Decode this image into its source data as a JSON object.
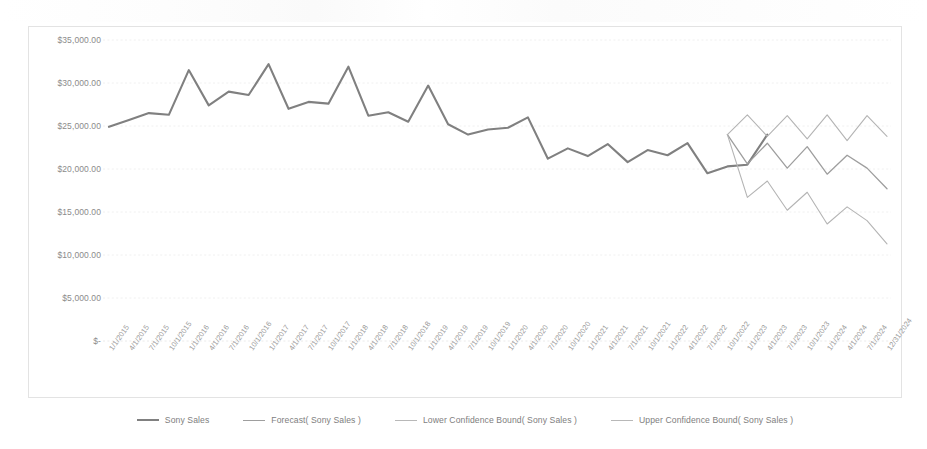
{
  "chart_data": {
    "type": "line",
    "title": "",
    "xlabel": "",
    "ylabel": "",
    "ylim": [
      0,
      35000
    ],
    "ytick_values": [
      35000,
      30000,
      25000,
      20000,
      15000,
      10000,
      5000,
      0
    ],
    "ytick_labels": [
      "$35,000.00",
      "$30,000.00",
      "$25,000.00",
      "$20,000.00",
      "$15,000.00",
      "$10,000.00",
      "$5,000.00",
      "$-"
    ],
    "grid": true,
    "legend_position": "bottom",
    "x": [
      "1/1/2015",
      "4/1/2015",
      "7/1/2015",
      "10/1/2015",
      "1/1/2016",
      "4/1/2016",
      "7/1/2016",
      "10/1/2016",
      "1/1/2017",
      "4/1/2017",
      "7/1/2017",
      "10/1/2017",
      "1/1/2018",
      "4/1/2018",
      "7/1/2018",
      "10/1/2018",
      "1/1/2019",
      "4/1/2019",
      "7/1/2019",
      "10/1/2019",
      "1/1/2020",
      "4/1/2020",
      "7/1/2020",
      "10/1/2020",
      "1/1/2021",
      "4/1/2021",
      "7/1/2021",
      "10/1/2021",
      "1/1/2022",
      "4/1/2022",
      "7/1/2022",
      "10/1/2022",
      "1/1/2023",
      "4/1/2023",
      "7/1/2023",
      "10/1/2023",
      "1/1/2024",
      "4/1/2024",
      "7/1/2024",
      "12/31/2024"
    ],
    "series": [
      {
        "name": "Sony Sales",
        "color": "#808080",
        "width": 2.1,
        "values": [
          24900,
          25700,
          26500,
          26300,
          31500,
          27400,
          29000,
          28600,
          32200,
          27000,
          27800,
          27600,
          31900,
          26200,
          26600,
          25500,
          29700,
          25200,
          24000,
          24600,
          24800,
          26000,
          21200,
          22400,
          21500,
          22900,
          20800,
          22200,
          21600,
          23000,
          19500,
          20300,
          20500,
          24000,
          null,
          null,
          null,
          null,
          null,
          null
        ]
      },
      {
        "name": "Forecast( Sony Sales )",
        "color": "#9e9e9e",
        "width": 1.3,
        "values": [
          null,
          null,
          null,
          null,
          null,
          null,
          null,
          null,
          null,
          null,
          null,
          null,
          null,
          null,
          null,
          null,
          null,
          null,
          null,
          null,
          null,
          null,
          null,
          null,
          null,
          null,
          null,
          null,
          null,
          null,
          null,
          24000,
          20600,
          23000,
          20100,
          22600,
          19400,
          21600,
          20100,
          17700
        ]
      },
      {
        "name": "Lower Confidence Bound( Sony Sales )",
        "color": "#b4b4b4",
        "width": 1.1,
        "values": [
          null,
          null,
          null,
          null,
          null,
          null,
          null,
          null,
          null,
          null,
          null,
          null,
          null,
          null,
          null,
          null,
          null,
          null,
          null,
          null,
          null,
          null,
          null,
          null,
          null,
          null,
          null,
          null,
          null,
          null,
          null,
          24000,
          16700,
          18600,
          15200,
          17300,
          13600,
          15600,
          14000,
          11300
        ]
      },
      {
        "name": "Upper Confidence Bound( Sony Sales )",
        "color": "#b4b4b4",
        "width": 1.1,
        "values": [
          null,
          null,
          null,
          null,
          null,
          null,
          null,
          null,
          null,
          null,
          null,
          null,
          null,
          null,
          null,
          null,
          null,
          null,
          null,
          null,
          null,
          null,
          null,
          null,
          null,
          null,
          null,
          null,
          null,
          null,
          null,
          24000,
          26300,
          23800,
          26200,
          23500,
          26300,
          23300,
          26200,
          23800
        ]
      }
    ]
  },
  "legend": {
    "items": [
      {
        "label": "Sony Sales",
        "color": "#808080",
        "width": 2.4
      },
      {
        "label": "Forecast( Sony Sales )",
        "color": "#9e9e9e",
        "width": 1.6
      },
      {
        "label": "Lower Confidence Bound( Sony Sales )",
        "color": "#b8b8b8",
        "width": 1.2
      },
      {
        "label": "Upper Confidence Bound( Sony Sales )",
        "color": "#b8b8b8",
        "width": 1.2
      }
    ]
  }
}
